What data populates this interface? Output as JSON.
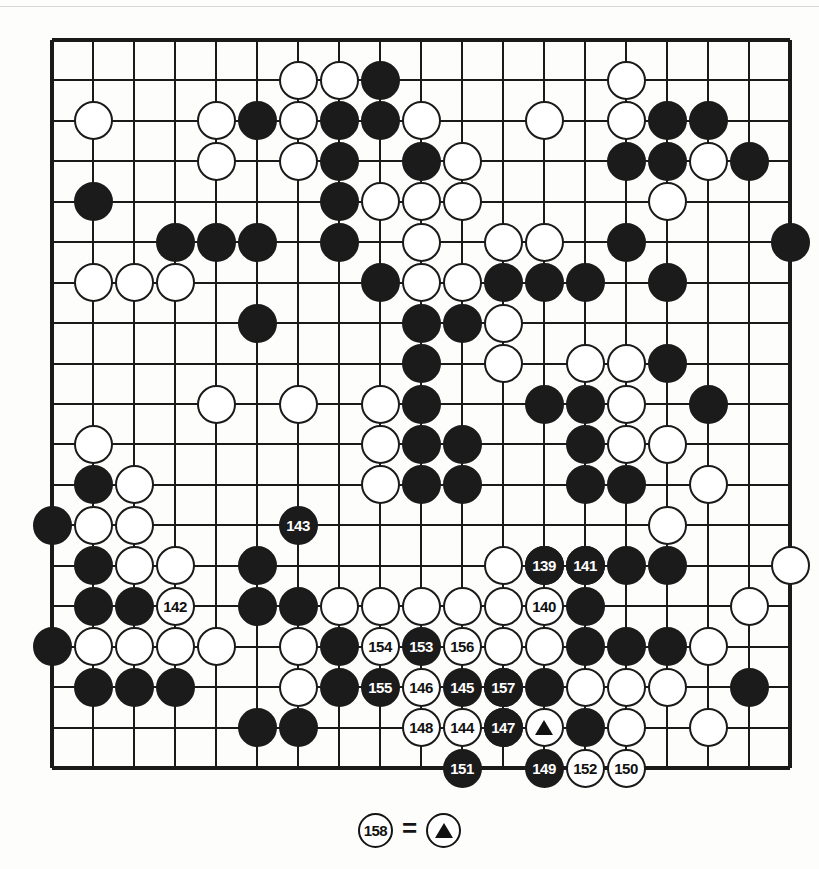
{
  "figure": {
    "type": "go-board-diagram",
    "board_size": 19,
    "colors": {
      "black": "#1b1b1b",
      "white": "#ffffff",
      "line": "#1a1a1a",
      "paper": "#fdfdfb"
    }
  },
  "caption": {
    "move_label": "158",
    "equals": "=",
    "marker": "triangle",
    "text": "158 = triangle"
  },
  "board": {
    "star_points": [
      [
        10,
        10
      ]
    ],
    "plain_stones": [
      {
        "c": "w",
        "x": 7,
        "y": 2
      },
      {
        "c": "w",
        "x": 8,
        "y": 2
      },
      {
        "c": "b",
        "x": 9,
        "y": 2
      },
      {
        "c": "w",
        "x": 15,
        "y": 2
      },
      {
        "c": "w",
        "x": 2,
        "y": 3
      },
      {
        "c": "w",
        "x": 5,
        "y": 3
      },
      {
        "c": "b",
        "x": 6,
        "y": 3
      },
      {
        "c": "w",
        "x": 7,
        "y": 3
      },
      {
        "c": "b",
        "x": 8,
        "y": 3
      },
      {
        "c": "b",
        "x": 9,
        "y": 3
      },
      {
        "c": "w",
        "x": 10,
        "y": 3
      },
      {
        "c": "w",
        "x": 13,
        "y": 3
      },
      {
        "c": "w",
        "x": 15,
        "y": 3
      },
      {
        "c": "b",
        "x": 16,
        "y": 3
      },
      {
        "c": "b",
        "x": 17,
        "y": 3
      },
      {
        "c": "w",
        "x": 5,
        "y": 4
      },
      {
        "c": "w",
        "x": 7,
        "y": 4
      },
      {
        "c": "b",
        "x": 8,
        "y": 4
      },
      {
        "c": "b",
        "x": 10,
        "y": 4
      },
      {
        "c": "w",
        "x": 11,
        "y": 4
      },
      {
        "c": "b",
        "x": 15,
        "y": 4
      },
      {
        "c": "b",
        "x": 16,
        "y": 4
      },
      {
        "c": "w",
        "x": 17,
        "y": 4
      },
      {
        "c": "b",
        "x": 18,
        "y": 4
      },
      {
        "c": "b",
        "x": 2,
        "y": 5
      },
      {
        "c": "b",
        "x": 8,
        "y": 5
      },
      {
        "c": "w",
        "x": 9,
        "y": 5
      },
      {
        "c": "w",
        "x": 10,
        "y": 5
      },
      {
        "c": "w",
        "x": 11,
        "y": 5
      },
      {
        "c": "w",
        "x": 16,
        "y": 5
      },
      {
        "c": "b",
        "x": 4,
        "y": 6
      },
      {
        "c": "b",
        "x": 5,
        "y": 6
      },
      {
        "c": "b",
        "x": 6,
        "y": 6
      },
      {
        "c": "b",
        "x": 8,
        "y": 6
      },
      {
        "c": "w",
        "x": 10,
        "y": 6
      },
      {
        "c": "w",
        "x": 12,
        "y": 6
      },
      {
        "c": "w",
        "x": 13,
        "y": 6
      },
      {
        "c": "b",
        "x": 15,
        "y": 6
      },
      {
        "c": "b",
        "x": 19,
        "y": 6
      },
      {
        "c": "w",
        "x": 2,
        "y": 7
      },
      {
        "c": "w",
        "x": 3,
        "y": 7
      },
      {
        "c": "w",
        "x": 4,
        "y": 7
      },
      {
        "c": "b",
        "x": 9,
        "y": 7
      },
      {
        "c": "w",
        "x": 10,
        "y": 7
      },
      {
        "c": "w",
        "x": 11,
        "y": 7
      },
      {
        "c": "b",
        "x": 12,
        "y": 7
      },
      {
        "c": "b",
        "x": 13,
        "y": 7
      },
      {
        "c": "b",
        "x": 14,
        "y": 7
      },
      {
        "c": "b",
        "x": 16,
        "y": 7
      },
      {
        "c": "b",
        "x": 6,
        "y": 8
      },
      {
        "c": "b",
        "x": 10,
        "y": 8
      },
      {
        "c": "b",
        "x": 11,
        "y": 8
      },
      {
        "c": "w",
        "x": 12,
        "y": 8
      },
      {
        "c": "b",
        "x": 10,
        "y": 9
      },
      {
        "c": "w",
        "x": 12,
        "y": 9
      },
      {
        "c": "w",
        "x": 14,
        "y": 9
      },
      {
        "c": "w",
        "x": 15,
        "y": 9
      },
      {
        "c": "b",
        "x": 16,
        "y": 9
      },
      {
        "c": "w",
        "x": 5,
        "y": 10
      },
      {
        "c": "w",
        "x": 7,
        "y": 10
      },
      {
        "c": "w",
        "x": 9,
        "y": 10
      },
      {
        "c": "b",
        "x": 10,
        "y": 10
      },
      {
        "c": "b",
        "x": 13,
        "y": 10
      },
      {
        "c": "b",
        "x": 14,
        "y": 10
      },
      {
        "c": "w",
        "x": 15,
        "y": 10
      },
      {
        "c": "b",
        "x": 17,
        "y": 10
      },
      {
        "c": "w",
        "x": 2,
        "y": 11
      },
      {
        "c": "w",
        "x": 9,
        "y": 11
      },
      {
        "c": "b",
        "x": 10,
        "y": 11
      },
      {
        "c": "b",
        "x": 11,
        "y": 11
      },
      {
        "c": "b",
        "x": 14,
        "y": 11
      },
      {
        "c": "w",
        "x": 15,
        "y": 11
      },
      {
        "c": "w",
        "x": 16,
        "y": 11
      },
      {
        "c": "b",
        "x": 2,
        "y": 12
      },
      {
        "c": "w",
        "x": 3,
        "y": 12
      },
      {
        "c": "w",
        "x": 9,
        "y": 12
      },
      {
        "c": "b",
        "x": 10,
        "y": 12
      },
      {
        "c": "b",
        "x": 11,
        "y": 12
      },
      {
        "c": "b",
        "x": 14,
        "y": 12
      },
      {
        "c": "b",
        "x": 15,
        "y": 12
      },
      {
        "c": "w",
        "x": 17,
        "y": 12
      },
      {
        "c": "b",
        "x": 1,
        "y": 13
      },
      {
        "c": "w",
        "x": 2,
        "y": 13
      },
      {
        "c": "w",
        "x": 3,
        "y": 13
      },
      {
        "c": "w",
        "x": 16,
        "y": 13
      },
      {
        "c": "b",
        "x": 2,
        "y": 14
      },
      {
        "c": "w",
        "x": 3,
        "y": 14
      },
      {
        "c": "w",
        "x": 4,
        "y": 14
      },
      {
        "c": "b",
        "x": 6,
        "y": 14
      },
      {
        "c": "w",
        "x": 12,
        "y": 14
      },
      {
        "c": "b",
        "x": 13,
        "y": 14
      },
      {
        "c": "b",
        "x": 14,
        "y": 14
      },
      {
        "c": "b",
        "x": 15,
        "y": 14
      },
      {
        "c": "b",
        "x": 16,
        "y": 14
      },
      {
        "c": "w",
        "x": 19,
        "y": 14
      },
      {
        "c": "b",
        "x": 2,
        "y": 15
      },
      {
        "c": "b",
        "x": 3,
        "y": 15
      },
      {
        "c": "b",
        "x": 6,
        "y": 15
      },
      {
        "c": "b",
        "x": 7,
        "y": 15
      },
      {
        "c": "w",
        "x": 8,
        "y": 15
      },
      {
        "c": "w",
        "x": 9,
        "y": 15
      },
      {
        "c": "w",
        "x": 10,
        "y": 15
      },
      {
        "c": "w",
        "x": 11,
        "y": 15
      },
      {
        "c": "w",
        "x": 12,
        "y": 15
      },
      {
        "c": "b",
        "x": 14,
        "y": 15
      },
      {
        "c": "w",
        "x": 18,
        "y": 15
      },
      {
        "c": "b",
        "x": 1,
        "y": 16
      },
      {
        "c": "w",
        "x": 2,
        "y": 16
      },
      {
        "c": "w",
        "x": 3,
        "y": 16
      },
      {
        "c": "w",
        "x": 4,
        "y": 16
      },
      {
        "c": "w",
        "x": 5,
        "y": 16
      },
      {
        "c": "w",
        "x": 7,
        "y": 16
      },
      {
        "c": "b",
        "x": 8,
        "y": 16
      },
      {
        "c": "w",
        "x": 12,
        "y": 16
      },
      {
        "c": "w",
        "x": 13,
        "y": 16
      },
      {
        "c": "b",
        "x": 14,
        "y": 16
      },
      {
        "c": "b",
        "x": 15,
        "y": 16
      },
      {
        "c": "b",
        "x": 16,
        "y": 16
      },
      {
        "c": "w",
        "x": 17,
        "y": 16
      },
      {
        "c": "b",
        "x": 2,
        "y": 17
      },
      {
        "c": "b",
        "x": 3,
        "y": 17
      },
      {
        "c": "b",
        "x": 4,
        "y": 17
      },
      {
        "c": "w",
        "x": 7,
        "y": 17
      },
      {
        "c": "b",
        "x": 8,
        "y": 17
      },
      {
        "c": "b",
        "x": 12,
        "y": 17
      },
      {
        "c": "b",
        "x": 13,
        "y": 17
      },
      {
        "c": "w",
        "x": 14,
        "y": 17
      },
      {
        "c": "w",
        "x": 15,
        "y": 17
      },
      {
        "c": "w",
        "x": 16,
        "y": 17
      },
      {
        "c": "b",
        "x": 18,
        "y": 17
      },
      {
        "c": "b",
        "x": 6,
        "y": 18
      },
      {
        "c": "b",
        "x": 7,
        "y": 18
      },
      {
        "c": "b",
        "x": 12,
        "y": 18
      },
      {
        "c": "b",
        "x": 14,
        "y": 18
      },
      {
        "c": "w",
        "x": 15,
        "y": 18
      },
      {
        "c": "w",
        "x": 17,
        "y": 18
      }
    ],
    "marked_stones": [
      {
        "c": "w",
        "x": 13,
        "y": 18,
        "mark": "triangle"
      }
    ],
    "numbered_moves": [
      {
        "n": "139",
        "c": "b",
        "x": 13,
        "y": 14
      },
      {
        "n": "140",
        "c": "w",
        "x": 13,
        "y": 15
      },
      {
        "n": "141",
        "c": "b",
        "x": 14,
        "y": 14
      },
      {
        "n": "142",
        "c": "w",
        "x": 4,
        "y": 15
      },
      {
        "n": "143",
        "c": "b",
        "x": 7,
        "y": 13
      },
      {
        "n": "144",
        "c": "w",
        "x": 11,
        "y": 18
      },
      {
        "n": "145",
        "c": "b",
        "x": 11,
        "y": 17
      },
      {
        "n": "146",
        "c": "w",
        "x": 10,
        "y": 17
      },
      {
        "n": "147",
        "c": "b",
        "x": 12,
        "y": 18
      },
      {
        "n": "148",
        "c": "w",
        "x": 10,
        "y": 18
      },
      {
        "n": "149",
        "c": "b",
        "x": 13,
        "y": 19
      },
      {
        "n": "150",
        "c": "w",
        "x": 15,
        "y": 19
      },
      {
        "n": "151",
        "c": "b",
        "x": 11,
        "y": 19
      },
      {
        "n": "152",
        "c": "w",
        "x": 14,
        "y": 19
      },
      {
        "n": "153",
        "c": "b",
        "x": 10,
        "y": 16
      },
      {
        "n": "154",
        "c": "w",
        "x": 9,
        "y": 16
      },
      {
        "n": "155",
        "c": "b",
        "x": 9,
        "y": 17
      },
      {
        "n": "156",
        "c": "w",
        "x": 11,
        "y": 16
      },
      {
        "n": "157",
        "c": "b",
        "x": 12,
        "y": 17
      }
    ]
  }
}
